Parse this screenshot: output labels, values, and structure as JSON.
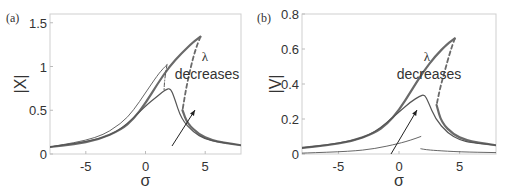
{
  "chart_data": [
    {
      "panel_label": "(a)",
      "type": "line",
      "title": "",
      "xlabel": "σ",
      "ylabel": "|X|",
      "xlim": [
        -8,
        8
      ],
      "ylim": [
        0,
        1.6
      ],
      "xticks": [
        "-5",
        "0",
        "5"
      ],
      "yticks": [
        "0",
        "0.5",
        "1",
        "1.5"
      ],
      "grid": false,
      "annotation": {
        "symbol": "λ",
        "text": "decreases",
        "arrow": true
      },
      "series": [
        {
          "name": "largest λ (stable branch)",
          "style": "thick solid",
          "x": [
            -8,
            -6,
            -4,
            -2,
            -1,
            0,
            1,
            2,
            3,
            4,
            4.6
          ],
          "y": [
            0.08,
            0.11,
            0.16,
            0.28,
            0.4,
            0.58,
            0.8,
            1.0,
            1.15,
            1.28,
            1.34
          ]
        },
        {
          "name": "largest λ (unstable branch)",
          "style": "dashed",
          "x": [
            4.6,
            4.2,
            3.8,
            3.4,
            3.1
          ],
          "y": [
            1.34,
            1.2,
            1.0,
            0.75,
            0.5
          ]
        },
        {
          "name": "largest λ (lower branch)",
          "style": "thick solid",
          "x": [
            3.1,
            3.5,
            4.5,
            5.5,
            6.5,
            8
          ],
          "y": [
            0.5,
            0.35,
            0.22,
            0.16,
            0.13,
            0.1
          ]
        },
        {
          "name": "intermediate λ",
          "style": "solid",
          "x": [
            -8,
            -4,
            -2,
            0,
            1,
            1.7,
            2.1,
            2.4,
            3,
            4,
            5,
            6,
            8
          ],
          "y": [
            0.08,
            0.16,
            0.28,
            0.55,
            0.66,
            0.74,
            0.75,
            0.65,
            0.4,
            0.25,
            0.17,
            0.14,
            0.1
          ]
        },
        {
          "name": "smallest λ",
          "style": "thin solid",
          "x": [
            -8,
            -4,
            -2,
            -1,
            0,
            1,
            1.5,
            1.8
          ],
          "y": [
            0.08,
            0.18,
            0.35,
            0.5,
            0.7,
            0.9,
            0.98,
            1.02
          ]
        },
        {
          "name": "smallest λ (unstable)",
          "style": "dash-dot",
          "x": [
            1.8,
            1.6,
            1.55
          ],
          "y": [
            1.02,
            0.85,
            0.72
          ]
        }
      ]
    },
    {
      "panel_label": "(b)",
      "type": "line",
      "title": "",
      "xlabel": "σ",
      "ylabel": "|V|",
      "xlim": [
        -8,
        8
      ],
      "ylim": [
        0,
        0.8
      ],
      "xticks": [
        "-5",
        "0",
        "5"
      ],
      "yticks": [
        "0",
        "0.2",
        "0.4",
        "0.6",
        "0.8"
      ],
      "grid": false,
      "annotation": {
        "symbol": "λ",
        "text": "decreases",
        "arrow": true
      },
      "series": [
        {
          "name": "largest λ (stable branch)",
          "style": "thick solid",
          "x": [
            -8,
            -6,
            -4,
            -2,
            -1,
            0,
            1,
            2,
            3,
            4,
            4.6
          ],
          "y": [
            0.035,
            0.05,
            0.07,
            0.12,
            0.17,
            0.25,
            0.36,
            0.47,
            0.56,
            0.63,
            0.66
          ]
        },
        {
          "name": "largest λ (unstable branch)",
          "style": "dashed",
          "x": [
            4.6,
            4.2,
            3.8,
            3.4,
            3.1
          ],
          "y": [
            0.66,
            0.58,
            0.48,
            0.38,
            0.28
          ]
        },
        {
          "name": "largest λ (lower branch)",
          "style": "thick solid",
          "x": [
            3.1,
            3.5,
            4.5,
            5.5,
            6.5,
            8
          ],
          "y": [
            0.28,
            0.18,
            0.11,
            0.08,
            0.065,
            0.05
          ]
        },
        {
          "name": "intermediate λ",
          "style": "solid",
          "x": [
            -8,
            -4,
            -2,
            0,
            1,
            1.7,
            2.1,
            2.4,
            3,
            4,
            5,
            6,
            8
          ],
          "y": [
            0.035,
            0.07,
            0.12,
            0.24,
            0.3,
            0.33,
            0.34,
            0.3,
            0.2,
            0.12,
            0.08,
            0.065,
            0.05
          ]
        },
        {
          "name": "smallest λ",
          "style": "thin solid",
          "x": [
            -8,
            -4,
            -2,
            0,
            1,
            1.8
          ],
          "y": [
            0.005,
            0.015,
            0.03,
            0.06,
            0.08,
            0.1
          ]
        },
        {
          "name": "smallest λ (lower)",
          "style": "thin solid",
          "x": [
            1.8,
            2.2,
            3,
            5,
            8
          ],
          "y": [
            0.03,
            0.025,
            0.02,
            0.012,
            0.008
          ]
        }
      ]
    }
  ]
}
